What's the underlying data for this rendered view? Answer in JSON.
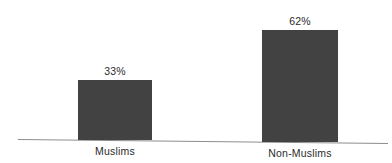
{
  "chart_data": {
    "type": "bar",
    "title": "",
    "xlabel": "",
    "ylabel": "",
    "categories": [
      "Muslims",
      "Non-Muslims"
    ],
    "values": [
      33,
      62
    ],
    "value_labels": [
      "33%",
      "62%"
    ],
    "unit": "%",
    "ylim": [
      0,
      100
    ],
    "grid": false,
    "legend": false,
    "axis": {
      "x_axis_visible": true,
      "y_axis_visible": false,
      "tick_labels_visible": false
    },
    "colors": {
      "bar_fill": "#424242",
      "background": "#ffffff",
      "axis_line": "#8c8c8c",
      "text": "#2b2b2b"
    }
  }
}
